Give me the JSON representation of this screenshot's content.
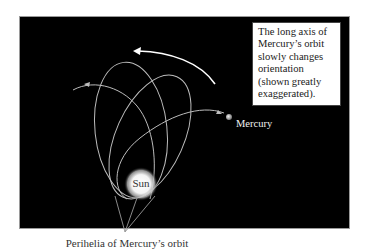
{
  "diagram": {
    "caption_lines": [
      "The long axis of",
      "Mercury’s orbit",
      "slowly changes",
      "orientation",
      "(shown greatly",
      "exaggerated)."
    ],
    "labels": {
      "sun": "Sun",
      "mercury": "Mercury",
      "perihelia": "Perihelia of Mercury’s orbit"
    },
    "orbit_count": 3,
    "perihelion_count": 3,
    "rotation_arrow_direction": "counterclockwise",
    "colors": {
      "background": "#000000",
      "orbit": "#bdbdbd",
      "arrow": "#ffffff",
      "sun_glow": "#ffffff",
      "caption_box": "#ffffff",
      "pointer_lines": "#9a9a9a"
    }
  }
}
